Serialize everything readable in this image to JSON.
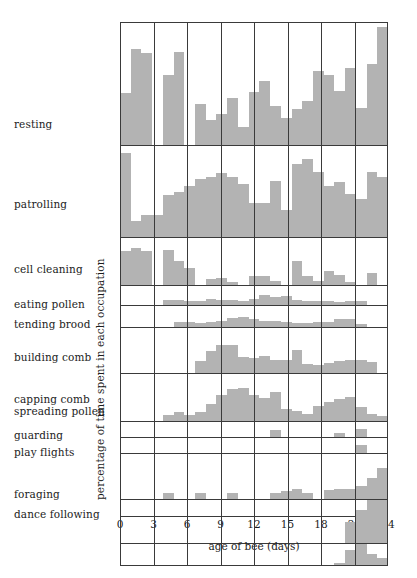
{
  "chart_data": {
    "type": "bar",
    "title": "",
    "subtitle": "",
    "xlabel": "age of bee (days)",
    "ylabel": "percentage of time spent in each occupation",
    "xlim": [
      0,
      24
    ],
    "x_ticks": [
      0,
      3,
      6,
      9,
      12,
      15,
      18,
      21,
      24
    ],
    "grid": "vertical gridlines at every 3 days",
    "legend": "none",
    "bar_color": "#b3b3b3",
    "axis_color": "#3a3a3a",
    "note": "Small-multiples stacked histogram: one panel per occupation, 24 daily bars (day 0 to day 24). Values are percentage of time spent in that occupation; panel heights differ so each panel has its own y-scale implied by the plot area height.",
    "categories": [
      0,
      1,
      2,
      3,
      4,
      5,
      6,
      7,
      8,
      9,
      10,
      11,
      12,
      13,
      14,
      15,
      16,
      17,
      18,
      19,
      20,
      21,
      22,
      23
    ],
    "panels": [
      {
        "name": "resting",
        "label": "resting",
        "panel_height_px": 124,
        "ymax": 100,
        "values": [
          42,
          78,
          75,
          0,
          57,
          76,
          0,
          33,
          20,
          25,
          38,
          15,
          43,
          52,
          32,
          22,
          29,
          36,
          60,
          57,
          44,
          63,
          30,
          66,
          96,
          15
        ]
      },
      {
        "name": "patrolling",
        "label": "patrolling",
        "panel_height_px": 92,
        "ymax": 100,
        "values": [
          92,
          18,
          24,
          24,
          46,
          50,
          56,
          64,
          66,
          70,
          66,
          58,
          37,
          37,
          62,
          30,
          80,
          86,
          72,
          56,
          60,
          47,
          42,
          72,
          66,
          54,
          24,
          12,
          20
        ]
      },
      {
        "name": "cell-cleaning",
        "label": "cell cleaning",
        "panel_height_px": 48,
        "ymax": 100,
        "values": [
          72,
          78,
          72,
          0,
          74,
          52,
          36,
          0,
          12,
          16,
          6,
          0,
          20,
          20,
          8,
          0,
          52,
          20,
          8,
          30,
          22,
          6,
          0,
          26,
          0,
          12,
          18
        ]
      },
      {
        "name": "eating-pollen",
        "label": "eating pollen",
        "panel_height_px": 20,
        "ymax": 100,
        "values": [
          0,
          0,
          0,
          0,
          28,
          24,
          22,
          22,
          34,
          28,
          26,
          22,
          30,
          55,
          42,
          50,
          26,
          20,
          22,
          22,
          18,
          22,
          22,
          0,
          0
        ]
      },
      {
        "name": "tending-brood",
        "label": "tending brood",
        "panel_height_px": 22,
        "ymax": 100,
        "values": [
          0,
          0,
          0,
          0,
          0,
          24,
          22,
          18,
          22,
          30,
          44,
          48,
          40,
          30,
          28,
          24,
          20,
          20,
          22,
          22,
          40,
          40,
          16,
          0,
          0
        ]
      },
      {
        "name": "building-comb",
        "label": "building comb",
        "panel_height_px": 46,
        "ymax": 100,
        "values": [
          0,
          0,
          0,
          0,
          0,
          0,
          0,
          26,
          50,
          62,
          62,
          36,
          34,
          38,
          30,
          30,
          52,
          20,
          18,
          22,
          26,
          30,
          30,
          24,
          0,
          0
        ]
      },
      {
        "name": "capping-comb",
        "label": "capping comb",
        "panel_height_px": 48,
        "ymax": 100,
        "values": [
          0,
          0,
          0,
          0,
          12,
          20,
          12,
          20,
          36,
          56,
          68,
          70,
          56,
          48,
          62,
          26,
          22,
          14,
          32,
          40,
          46,
          52,
          30,
          14,
          10,
          8,
          96
        ]
      },
      {
        "name": "spreading-pollen",
        "label": "spreading pollen",
        "panel_height_px": 16,
        "ymax": 100,
        "values": [
          0,
          0,
          0,
          0,
          0,
          0,
          0,
          0,
          0,
          0,
          0,
          0,
          0,
          0,
          48,
          0,
          0,
          0,
          0,
          0,
          30,
          0,
          52,
          0,
          0,
          100
        ]
      },
      {
        "name": "guarding",
        "label": "guarding",
        "panel_height_px": 16,
        "ymax": 100,
        "values": [
          0,
          0,
          0,
          0,
          0,
          0,
          0,
          0,
          0,
          0,
          0,
          0,
          0,
          0,
          0,
          0,
          0,
          0,
          0,
          0,
          0,
          0,
          56,
          0,
          0,
          100
        ]
      },
      {
        "name": "play-flights",
        "label": "play flights",
        "panel_height_px": 46,
        "ymax": 100,
        "values": [
          0,
          0,
          0,
          0,
          14,
          0,
          0,
          14,
          0,
          0,
          14,
          0,
          0,
          0,
          14,
          18,
          22,
          14,
          0,
          20,
          22,
          22,
          30,
          46,
          70,
          100
        ]
      },
      {
        "name": "foraging",
        "label": "foraging",
        "panel_height_px": 44,
        "ymax": 100,
        "values": [
          0,
          0,
          0,
          0,
          0,
          0,
          0,
          0,
          0,
          0,
          0,
          0,
          0,
          0,
          0,
          0,
          0,
          0,
          0,
          0,
          0,
          48,
          78,
          100,
          100
        ]
      },
      {
        "name": "dance-following",
        "label": "dance following",
        "panel_height_px": 22,
        "ymax": 100,
        "values": [
          0,
          0,
          0,
          0,
          0,
          0,
          0,
          0,
          0,
          0,
          0,
          0,
          0,
          0,
          0,
          0,
          0,
          0,
          0,
          0,
          10,
          72,
          100,
          54,
          34,
          18
        ]
      }
    ]
  },
  "labels": {
    "resting": "resting",
    "patrolling": "patrolling",
    "cell_cleaning": "cell cleaning",
    "eating_pollen": "eating pollen",
    "tending_brood": "tending brood",
    "building_comb": "building comb",
    "capping_comb": "capping comb",
    "spreading_pollen": "spreading pollen",
    "guarding": "guarding",
    "play_flights": "play flights",
    "foraging": "foraging",
    "dance_following": "dance following"
  },
  "axes": {
    "y_title": "percentage of time spent in each occupation",
    "x_title": "age of bee (days)",
    "x_ticks": [
      "0",
      "3",
      "6",
      "9",
      "12",
      "15",
      "18",
      "21",
      "24"
    ]
  }
}
